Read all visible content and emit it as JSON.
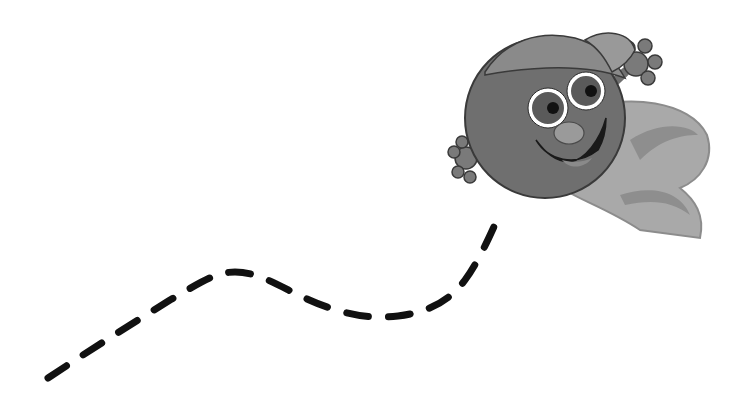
{
  "scene": {
    "description": "Grayscale cartoon of a smiling ball character wearing a cap and cape, flying upward along a dashed trail",
    "background": "#ffffff",
    "character": {
      "name": "flying-ball-character",
      "body_color": "#6f6f6f",
      "cap_color": "#8a8a8a",
      "cape_color": "#a9a9a9",
      "outline_color": "#3a3a3a"
    },
    "trail": {
      "style": "dashed",
      "color": "#111111",
      "points": [
        [
          48,
          378
        ],
        [
          110,
          330
        ],
        [
          170,
          295
        ],
        [
          225,
          272
        ],
        [
          290,
          290
        ],
        [
          385,
          316
        ],
        [
          440,
          296
        ],
        [
          495,
          222
        ]
      ]
    }
  }
}
